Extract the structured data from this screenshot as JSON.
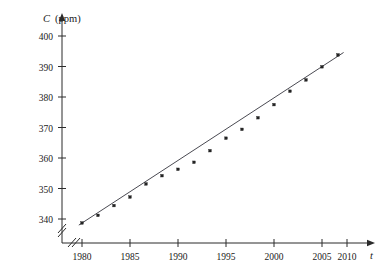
{
  "chart_data": {
    "type": "scatter",
    "title": "",
    "xlabel": "t",
    "ylabel": "C",
    "yunit": "(ppm)",
    "xlim": [
      1978.6,
      2013.8
    ],
    "ylim": [
      336.0,
      402.0
    ],
    "grid": false,
    "legend": "none",
    "axis_break": true,
    "xticks": [
      1980,
      1985,
      1990,
      1995,
      2000,
      2005,
      2010
    ],
    "xtick_labels": [
      "1980",
      "1985",
      "1990",
      "1995",
      "2000",
      "2005",
      "2010"
    ],
    "yticks": [
      340,
      350,
      360,
      370,
      380,
      390,
      400
    ],
    "ytick_labels": [
      "340",
      "350",
      "360",
      "370",
      "380",
      "390",
      "400"
    ],
    "x": [
      1980,
      1982,
      1984,
      1986,
      1988,
      1990,
      1992,
      1994,
      1996,
      1998,
      2000,
      2002,
      2004,
      2006,
      2008,
      2010,
      2012
    ],
    "values": [
      338.7,
      341.2,
      344.4,
      347.2,
      351.5,
      354.2,
      356.3,
      358.6,
      362.4,
      366.5,
      369.4,
      373.2,
      377.5,
      381.9,
      385.6,
      389.9,
      393.8
    ],
    "series": [
      {
        "name": "CO2 concentration",
        "x": [
          1980,
          1982,
          1984,
          1986,
          1988,
          1990,
          1992,
          1994,
          1996,
          1998,
          2000,
          2002,
          2004,
          2006,
          2008,
          2010,
          2012
        ],
        "values": [
          338.7,
          341.2,
          344.4,
          347.2,
          351.5,
          354.2,
          356.3,
          358.6,
          362.4,
          366.5,
          369.4,
          373.2,
          377.5,
          381.9,
          385.6,
          389.9,
          393.8
        ]
      }
    ],
    "fit_line": {
      "name": "regression line",
      "x_start": 1979.6,
      "y_start": 338.0,
      "x_end": 2012.7,
      "y_end": 394.6
    }
  }
}
